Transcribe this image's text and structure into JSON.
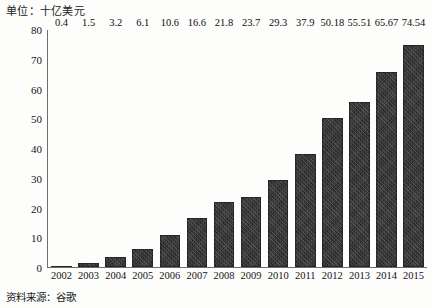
{
  "chart_data": {
    "type": "bar",
    "title": "单位：十亿美元",
    "xlabel": "",
    "ylabel": "",
    "ylim": [
      0,
      80
    ],
    "yticks": [
      0,
      10,
      20,
      30,
      40,
      50,
      60,
      70,
      80
    ],
    "grid": false,
    "legend": "none",
    "bar_color": "#3a3a3a",
    "categories": [
      "2002",
      "2003",
      "2004",
      "2005",
      "2006",
      "2007",
      "2008",
      "2009",
      "2010",
      "2011",
      "2012",
      "2013",
      "2014",
      "2015"
    ],
    "values": [
      0.4,
      1.5,
      3.2,
      6.1,
      10.6,
      16.6,
      21.8,
      23.7,
      29.3,
      37.9,
      50.18,
      55.51,
      65.67,
      74.54
    ],
    "value_labels": [
      "0.4",
      "1.5",
      "3.2",
      "6.1",
      "10.6",
      "16.6",
      "21.8",
      "23.7",
      "29.3",
      "37.9",
      "50.18",
      "55.51",
      "65.67",
      "74.54"
    ],
    "annotations": [
      "资料来源：谷歌"
    ]
  },
  "footer": {
    "source": "资料来源：谷歌"
  }
}
